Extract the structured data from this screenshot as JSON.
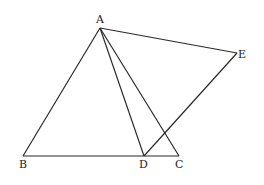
{
  "diagram": {
    "type": "geometry",
    "points": {
      "A": {
        "label": "A",
        "x": 100,
        "y": 28
      },
      "B": {
        "label": "B",
        "x": 23,
        "y": 156
      },
      "C": {
        "label": "C",
        "x": 179,
        "y": 156
      },
      "D": {
        "label": "D",
        "x": 144,
        "y": 156
      },
      "E": {
        "label": "E",
        "x": 237,
        "y": 53
      }
    },
    "segments": [
      "AB",
      "BC",
      "AC",
      "AD",
      "AE",
      "DE"
    ],
    "labels": {
      "A": "A",
      "B": "B",
      "C": "C",
      "D": "D",
      "E": "E"
    }
  }
}
